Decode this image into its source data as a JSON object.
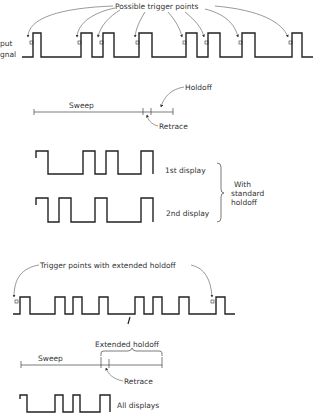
{
  "labels": {
    "possible_trigger_points": "Possible trigger points",
    "input_signal_line1": "put",
    "input_signal_line2": "gnal",
    "holdoff": "Holdoff",
    "sweep_1": "Sweep",
    "retrace_1": "Retrace",
    "first_display": "1st display",
    "second_display": "2nd display",
    "with": "With",
    "standard": "standard",
    "holdoff_word": "holdoff",
    "trigger_points_extended": "Trigger points with extended holdoff",
    "extended_holdoff": "Extended holdoff",
    "sweep_2": "Sweep",
    "retrace_2": "Retrace",
    "all_displays": "All displays"
  },
  "colors": {
    "background": "#ffffff",
    "line": "#222222",
    "text": "#333333"
  },
  "waveforms": {
    "input_signal": {
      "high_y": 33,
      "low_y": 57,
      "x_start": 22,
      "x_end": 313,
      "pulses": [
        [
          33,
          41
        ],
        [
          81,
          92
        ],
        [
          103,
          114
        ],
        [
          139,
          152
        ],
        [
          186,
          197
        ],
        [
          208,
          220
        ],
        [
          242,
          255
        ],
        [
          292,
          302
        ]
      ]
    },
    "first_display": {
      "high_y": 151,
      "low_y": 174,
      "x_start": 36,
      "x_end": 153
    },
    "second_display": {
      "high_y": 198,
      "low_y": 222,
      "x_start": 36,
      "x_end": 153
    },
    "extended_signal": {
      "high_y": 297,
      "low_y": 314,
      "x_start": 13,
      "x_end": 235,
      "pulses": [
        [
          20,
          30
        ],
        [
          55,
          65
        ],
        [
          73,
          82
        ],
        [
          99,
          108
        ],
        [
          135,
          144
        ],
        [
          153,
          162
        ],
        [
          179,
          189
        ],
        [
          216,
          225
        ]
      ]
    },
    "all_displays": {
      "high_y": 395,
      "low_y": 412,
      "x_start": 20,
      "x_end": 110
    }
  }
}
